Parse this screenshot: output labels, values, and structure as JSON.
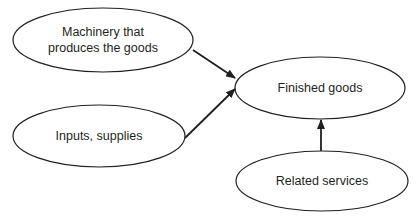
{
  "diagram": {
    "type": "flow",
    "stroke_color": "#231f20",
    "background": "#ffffff",
    "nodes": [
      {
        "id": "machinery",
        "label_lines": [
          "Machinery that",
          "produces the goods"
        ],
        "label": "Machinery that produces the goods",
        "cx": 103,
        "cy": 40,
        "rx": 90,
        "ry": 32
      },
      {
        "id": "inputs",
        "label_lines": [
          "Inputs, supplies"
        ],
        "label": "Inputs, supplies",
        "cx": 99,
        "cy": 136,
        "rx": 86,
        "ry": 31
      },
      {
        "id": "finished",
        "label_lines": [
          "Finished goods"
        ],
        "label": "Finished goods",
        "cx": 320,
        "cy": 88,
        "rx": 85,
        "ry": 31
      },
      {
        "id": "services",
        "label_lines": [
          "Related services"
        ],
        "label": "Related services",
        "cx": 322,
        "cy": 181,
        "rx": 86,
        "ry": 30
      }
    ],
    "edges": [
      {
        "from": "machinery",
        "to": "finished",
        "x1": 193,
        "y1": 50,
        "x2": 235,
        "y2": 78
      },
      {
        "from": "inputs",
        "to": "finished",
        "x1": 185,
        "y1": 138,
        "x2": 235,
        "y2": 89
      },
      {
        "from": "services",
        "to": "finished",
        "x1": 321,
        "y1": 151,
        "x2": 321,
        "y2": 120
      }
    ]
  }
}
